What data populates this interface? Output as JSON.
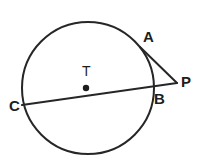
{
  "figure": {
    "kind": "circle-tangent-secant-diagram",
    "background_color": "#ffffff",
    "stroke_color": "#262626",
    "label_color": "#1d1d1d",
    "stroke_width": 2,
    "canvas": {
      "width": 199,
      "height": 166
    },
    "circle": {
      "name": "circle-T",
      "center_x": 88,
      "center_y": 88,
      "radius": 66
    },
    "center_point": {
      "name": "center-dot",
      "x": 86,
      "y": 88,
      "radius": 3.2
    },
    "points": {
      "A": {
        "label": "A",
        "x": 140,
        "y": 47
      },
      "B": {
        "label": "B",
        "x": 152,
        "y": 89
      },
      "C": {
        "label": "C",
        "x": 23,
        "y": 104
      },
      "P": {
        "label": "P",
        "x": 176,
        "y": 83
      },
      "T": {
        "label": "T",
        "x": 86,
        "y": 88
      }
    },
    "segments": [
      {
        "name": "tangent-AP",
        "from": "A",
        "to": "P",
        "x1": 140,
        "y1": 47,
        "x2": 177,
        "y2": 83
      },
      {
        "name": "secant-CP",
        "from": "C",
        "to": "P",
        "x1": 22,
        "y1": 105,
        "x2": 177,
        "y2": 83
      }
    ],
    "labels": {
      "A": "A",
      "B": "B",
      "C": "C",
      "P": "P",
      "T": "T"
    }
  }
}
